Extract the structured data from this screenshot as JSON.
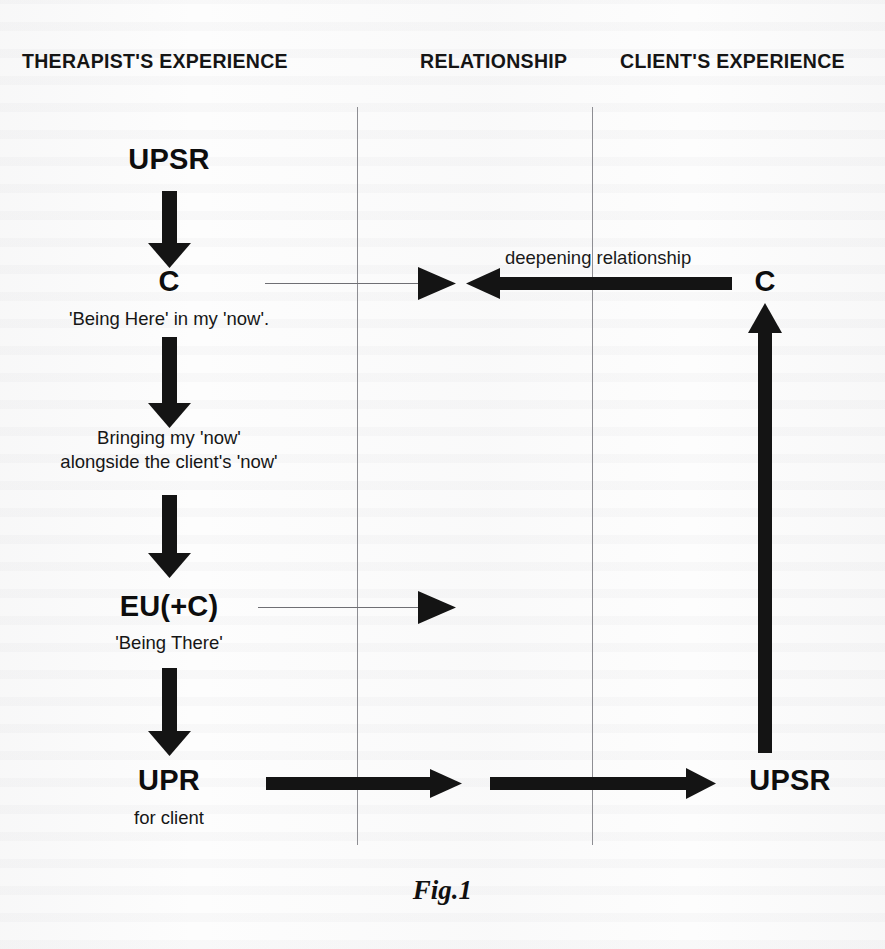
{
  "figure": {
    "caption": "Fig.1",
    "columns": [
      {
        "id": "therapist",
        "label": "THERAPIST'S EXPERIENCE"
      },
      {
        "id": "relationship",
        "label": "RELATIONSHIP"
      },
      {
        "id": "client",
        "label": "CLIENT'S EXPERIENCE"
      }
    ],
    "therapist_column": {
      "node_upsr": "UPSR",
      "node_c": "C",
      "note_being_here": "'Being Here' in my 'now'.",
      "note_bringing_line1": "Bringing my 'now'",
      "note_bringing_line2": "alongside the client's 'now'",
      "node_eu_c": "EU(+C)",
      "note_being_there": "'Being There'",
      "node_upr": "UPR",
      "note_for_client": "for client"
    },
    "client_column": {
      "node_c": "C",
      "node_upsr": "UPSR"
    },
    "relationship_column": {
      "edge_deepening": "deepening relationship"
    },
    "colors": {
      "ink": "#141414",
      "hairline": "#6f6f74",
      "paper": "#fdfdfd"
    }
  }
}
